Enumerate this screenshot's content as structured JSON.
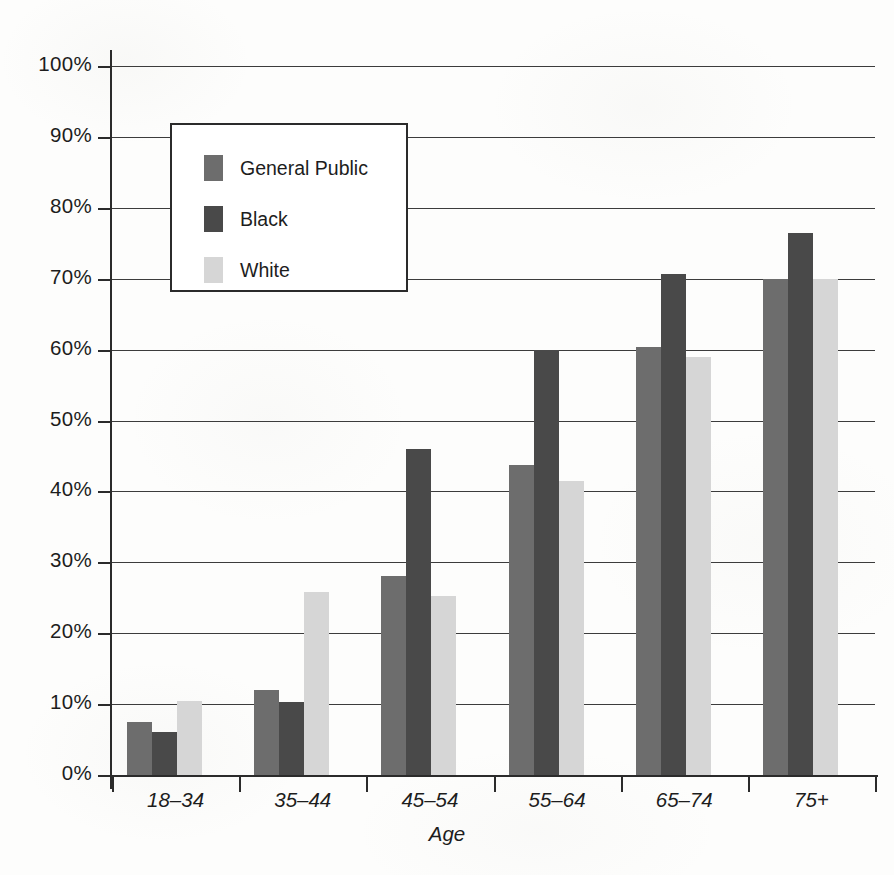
{
  "chart_data": {
    "type": "bar",
    "title": "",
    "subtitle": "",
    "xlabel": "Age",
    "ylabel": "",
    "categories": [
      "18–34",
      "35–44",
      "45–54",
      "55–64",
      "65–74",
      "75+"
    ],
    "series": [
      {
        "name": "General Public",
        "color": "#6d6d6d",
        "values": [
          7.5,
          12.0,
          28.0,
          43.7,
          60.3,
          70.0
        ]
      },
      {
        "name": "Black",
        "color": "#494949",
        "values": [
          6.0,
          10.3,
          46.0,
          60.0,
          70.7,
          76.5
        ]
      },
      {
        "name": "White",
        "color": "#d6d6d6",
        "values": [
          10.5,
          25.8,
          25.3,
          41.5,
          59.0,
          70.0
        ]
      }
    ],
    "ylim": [
      0,
      100
    ],
    "y_tick_labels": [
      "0%",
      "10%",
      "20%",
      "30%",
      "40%",
      "50%",
      "60%",
      "70%",
      "80%",
      "90%",
      "100%"
    ],
    "y_tick_values": [
      0,
      10,
      20,
      30,
      40,
      50,
      60,
      70,
      80,
      90,
      100
    ],
    "grid": true,
    "grid_axis": "y",
    "legend": {
      "position": "inside-upper-left",
      "entries": [
        {
          "label": "General Public",
          "color": "#6d6d6d"
        },
        {
          "label": "Black",
          "color": "#494949"
        },
        {
          "label": "White",
          "color": "#d6d6d6"
        }
      ]
    },
    "annotations": []
  },
  "colors": {
    "axis": "#2b2b2b",
    "gridline": "#3c3c3c",
    "text": "#1d1d1d",
    "background": "#fdfdfc",
    "legend_background": "#ffffff"
  }
}
